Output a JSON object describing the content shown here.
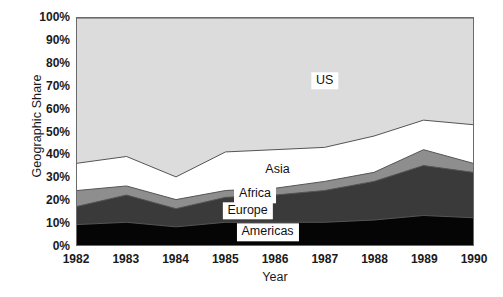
{
  "chart_data": {
    "type": "area",
    "stacked": true,
    "percent": true,
    "title": "",
    "xlabel": "Year",
    "ylabel": "Geographic Share",
    "x": [
      1982,
      1983,
      1984,
      1985,
      1986,
      1987,
      1988,
      1989,
      1990
    ],
    "categories": [
      "1982",
      "1983",
      "1984",
      "1985",
      "1986",
      "1987",
      "1988",
      "1989",
      "1990"
    ],
    "xtick_labels": [
      "1982",
      "1983",
      "1984",
      "1985",
      "1986",
      "1987",
      "1988",
      "1989",
      "1990"
    ],
    "ytick_labels": [
      "0%",
      "10%",
      "20%",
      "30%",
      "40%",
      "50%",
      "60%",
      "70%",
      "80%",
      "90%",
      "100%"
    ],
    "ytick_values": [
      0,
      10,
      20,
      30,
      40,
      50,
      60,
      70,
      80,
      90,
      100
    ],
    "ylim": [
      0,
      100
    ],
    "xlim": [
      1982,
      1990
    ],
    "grid": false,
    "legend": "inline-labels",
    "series": [
      {
        "name": "Americas",
        "color": "#050505",
        "values": [
          9,
          10,
          8,
          10,
          10,
          10,
          11,
          13,
          12
        ],
        "cumulative": [
          9,
          10,
          8,
          10,
          10,
          10,
          11,
          13,
          12
        ]
      },
      {
        "name": "Europe",
        "color": "#3a3a3a",
        "values": [
          8,
          12,
          8,
          11,
          12,
          14,
          17,
          22,
          20
        ],
        "cumulative": [
          17,
          22,
          16,
          21,
          22,
          24,
          28,
          35,
          32
        ]
      },
      {
        "name": "Africa",
        "color": "#8e8e8e",
        "values": [
          7,
          4,
          4,
          3,
          3,
          4,
          4,
          7,
          4
        ],
        "cumulative": [
          24,
          26,
          20,
          24,
          25,
          28,
          32,
          42,
          36
        ]
      },
      {
        "name": "Asia",
        "color": "#ffffff",
        "values": [
          12,
          13,
          10,
          17,
          17,
          15,
          16,
          13,
          17
        ],
        "cumulative": [
          36,
          39,
          30,
          41,
          42,
          43,
          48,
          55,
          53
        ]
      },
      {
        "name": "US",
        "color": "#dcdcdc",
        "values": [
          64,
          61,
          70,
          59,
          58,
          57,
          52,
          45,
          47
        ],
        "cumulative": [
          100,
          100,
          100,
          100,
          100,
          100,
          100,
          100,
          100
        ]
      }
    ],
    "series_label_positions": [
      {
        "name": "US",
        "x": 1987.0,
        "y": 72
      },
      {
        "name": "Asia",
        "x": 1986.05,
        "y": 33
      },
      {
        "name": "Africa",
        "x": 1985.6,
        "y": 22.5
      },
      {
        "name": "Europe",
        "x": 1985.45,
        "y": 15.5
      },
      {
        "name": "Americas",
        "x": 1985.85,
        "y": 6.0
      }
    ]
  },
  "colors": {
    "plot_border": "#6b6b6b",
    "series_outline": "#555555",
    "background": "#ffffff",
    "text": "#1a1a1a"
  }
}
